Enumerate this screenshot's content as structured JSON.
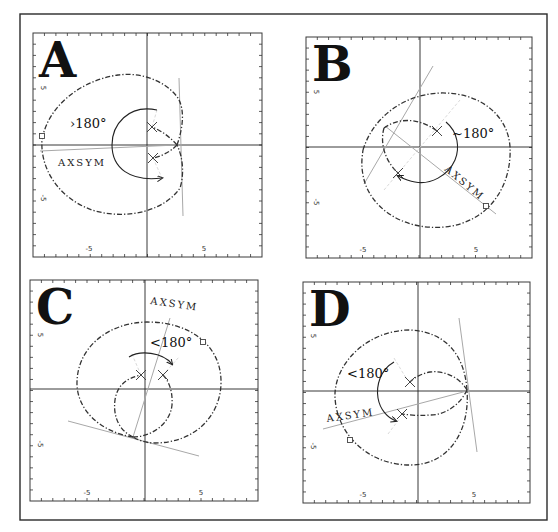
{
  "figure": {
    "outer_frame": {
      "x": 20,
      "y": 14,
      "w": 527,
      "h": 506
    },
    "panels": [
      {
        "id": "A",
        "letter": "A",
        "frame": {
          "x": 33,
          "y": 33,
          "w": 229,
          "h": 224
        },
        "origin": {
          "x": 147,
          "y": 145
        },
        "x_tick_labels": [
          {
            "text": "-5",
            "x": 89
          },
          {
            "text": "5",
            "x": 204
          }
        ],
        "y_tick_labels": [
          {
            "text": "5",
            "y": 88
          },
          {
            "text": "-5",
            "y": 198
          }
        ],
        "angle_label": {
          "text": "›180°",
          "x": 70,
          "y": 128
        },
        "axsym_label": {
          "text": "AXSYM",
          "x": 58,
          "y": 166,
          "rotate": 0
        },
        "loci": [
          "M177,145 C183,128 185,110 178,98 C165,80 140,72 118,75 C82,80 48,105 42,140 C40,170 60,200 95,211 C130,220 165,210 180,188 C185,172 182,155 177,145",
          "M177,145 C170,137 162,131 152,127",
          "M177,145 C170,152 162,156 153,158"
        ],
        "gray_lines": [
          {
            "x1": 179,
            "y1": 78,
            "x2": 183,
            "y2": 216
          },
          {
            "x1": 40,
            "y1": 151,
            "x2": 177,
            "y2": 145
          }
        ],
        "faint_lines": [
          {
            "x1": 152,
            "y1": 127,
            "x2": 157,
            "y2": 110
          },
          {
            "x1": 153,
            "y1": 158,
            "x2": 162,
            "y2": 178
          }
        ],
        "crosses": [
          {
            "x": 152,
            "y": 127
          },
          {
            "x": 153,
            "y": 158
          }
        ],
        "squares": [
          {
            "x": 42,
            "y": 136
          }
        ],
        "arc": "M157,110 C128,104 112,125 112,145 C112,168 130,182 162,178"
      },
      {
        "id": "B",
        "letter": "B",
        "frame": {
          "x": 306,
          "y": 37,
          "w": 226,
          "h": 221
        },
        "origin": {
          "x": 420,
          "y": 147
        },
        "x_tick_labels": [
          {
            "text": "-5",
            "x": 363
          },
          {
            "text": "5",
            "x": 476
          }
        ],
        "y_tick_labels": [
          {
            "text": "5",
            "y": 92
          },
          {
            "text": "-5",
            "y": 202
          }
        ],
        "angle_label": {
          "text": "~180°",
          "x": 452,
          "y": 138
        },
        "axsym_label": {
          "text": "AXSYM",
          "x": 444,
          "y": 170,
          "rotate": 40
        },
        "loci": [
          "M363,150 C372,120 400,95 440,93 C480,92 508,115 510,147 C512,185 490,222 445,227 C400,231 368,205 363,175 C361,165 362,157 363,150",
          "M384,128 C395,120 415,115 437,131",
          "M384,128 C380,142 384,160 398,173"
        ],
        "gray_lines": [
          {
            "x1": 364,
            "y1": 184,
            "x2": 433,
            "y2": 66
          },
          {
            "x1": 385,
            "y1": 126,
            "x2": 496,
            "y2": 214
          }
        ],
        "faint_lines": [
          {
            "x1": 384,
            "y1": 190,
            "x2": 460,
            "y2": 100
          }
        ],
        "crosses": [
          {
            "x": 437,
            "y": 131
          },
          {
            "x": 398,
            "y": 173
          }
        ],
        "squares": [
          {
            "x": 486,
            "y": 206
          }
        ],
        "arc": "M446,122 C458,132 460,148 455,160 C448,176 430,185 415,182 C408,181 402,178 398,176"
      },
      {
        "id": "C",
        "letter": "C",
        "frame": {
          "x": 30,
          "y": 280,
          "w": 228,
          "h": 221
        },
        "origin": {
          "x": 145,
          "y": 389
        },
        "x_tick_labels": [
          {
            "text": "-5",
            "x": 87
          },
          {
            "text": "5",
            "x": 201
          }
        ],
        "y_tick_labels": [
          {
            "text": "5",
            "y": 335
          },
          {
            "text": "-5",
            "y": 444
          }
        ],
        "angle_label": {
          "text": "<180°",
          "x": 150,
          "y": 347
        },
        "axsym_label": {
          "text": "AXSYM",
          "x": 150,
          "y": 304,
          "rotate": 8
        },
        "loci": [
          "M133,437 C100,432 78,410 77,385 C76,350 105,323 147,322 C190,322 220,345 221,380 C222,415 195,443 155,443 C145,443 138,440 133,437",
          "M133,437 C118,430 113,415 115,400 C117,386 126,378 141,375",
          "M133,437 C150,437 170,425 172,405 C173,390 168,380 163,375"
        ],
        "gray_lines": [
          {
            "x1": 68,
            "y1": 421,
            "x2": 199,
            "y2": 456
          },
          {
            "x1": 133,
            "y1": 437,
            "x2": 170,
            "y2": 318
          }
        ],
        "faint_lines": [
          {
            "x1": 141,
            "y1": 375,
            "x2": 131,
            "y2": 352
          },
          {
            "x1": 163,
            "y1": 375,
            "x2": 179,
            "y2": 357
          }
        ],
        "crosses": [
          {
            "x": 141,
            "y": 375
          },
          {
            "x": 163,
            "y": 375
          }
        ],
        "squares": [
          {
            "x": 203,
            "y": 342
          }
        ],
        "arc": "M129,357 C140,350 162,352 172,364"
      },
      {
        "id": "D",
        "letter": "D",
        "frame": {
          "x": 303,
          "y": 282,
          "w": 227,
          "h": 221
        },
        "origin": {
          "x": 418,
          "y": 391
        },
        "x_tick_labels": [
          {
            "text": "-5",
            "x": 363
          },
          {
            "text": "5",
            "x": 474
          }
        ],
        "y_tick_labels": [
          {
            "text": "5",
            "y": 336
          },
          {
            "text": "-5",
            "y": 446
          }
        ],
        "angle_label": {
          "text": "<180°",
          "x": 347,
          "y": 378
        },
        "axsym_label": {
          "text": "AXSYM",
          "x": 327,
          "y": 422,
          "rotate": -8
        },
        "loci": [
          "M467,390 C465,360 450,332 410,330 C370,330 337,360 335,393 C334,430 365,465 410,465 C450,465 470,430 467,390",
          "M467,390 C460,378 445,370 430,372 C420,374 414,378 410,382",
          "M467,390 C460,405 445,415 430,415 C418,416 410,415 402,414"
        ],
        "gray_lines": [
          {
            "x1": 459,
            "y1": 318,
            "x2": 477,
            "y2": 452
          },
          {
            "x1": 323,
            "y1": 429,
            "x2": 467,
            "y2": 391
          }
        ],
        "faint_lines": [
          {
            "x1": 394,
            "y1": 358,
            "x2": 406,
            "y2": 378
          },
          {
            "x1": 388,
            "y1": 434,
            "x2": 400,
            "y2": 418
          }
        ],
        "crosses": [
          {
            "x": 410,
            "y": 382
          },
          {
            "x": 402,
            "y": 414
          }
        ],
        "squares": [
          {
            "x": 350,
            "y": 440
          }
        ],
        "arc": "M394,362 C380,370 376,386 378,398 C380,410 388,418 396,421"
      }
    ]
  }
}
